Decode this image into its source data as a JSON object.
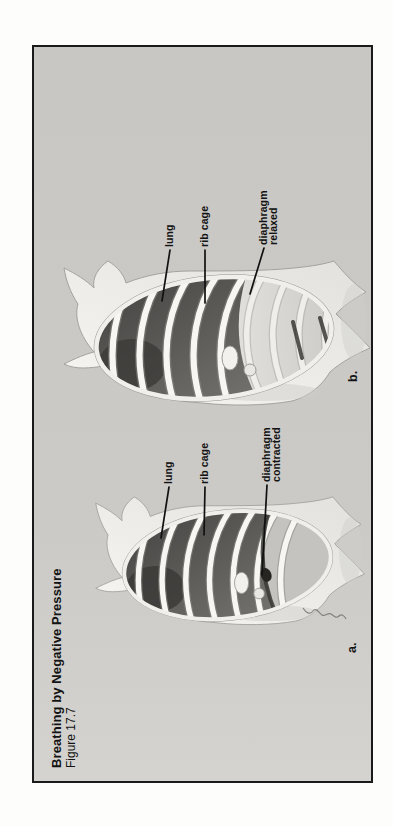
{
  "figure": {
    "title": "Breathing by Negative Pressure",
    "subtitle": "Figure 17.7",
    "panels": [
      {
        "id": "a",
        "corner_label": "a.",
        "annotations": [
          {
            "lines": [
              "lung",
              ""
            ]
          },
          {
            "lines": [
              "rib cage",
              ""
            ]
          },
          {
            "lines": [
              "diaphragm",
              "contracted"
            ]
          }
        ]
      },
      {
        "id": "b",
        "corner_label": "b.",
        "annotations": [
          {
            "lines": [
              "lung",
              ""
            ]
          },
          {
            "lines": [
              "rib cage",
              ""
            ]
          },
          {
            "lines": [
              "diaphragm",
              "relaxed"
            ]
          }
        ]
      }
    ],
    "colors": {
      "page_bg": "#fdfdfc",
      "plate_bg": "#cbcac7",
      "plate_border": "#1a1a1a",
      "text_ink": "#131313",
      "body_tone": "#f5f4f0",
      "lung_dark": "#454442",
      "rib_white": "#f7f6f2",
      "leader_line": "#111111"
    }
  }
}
